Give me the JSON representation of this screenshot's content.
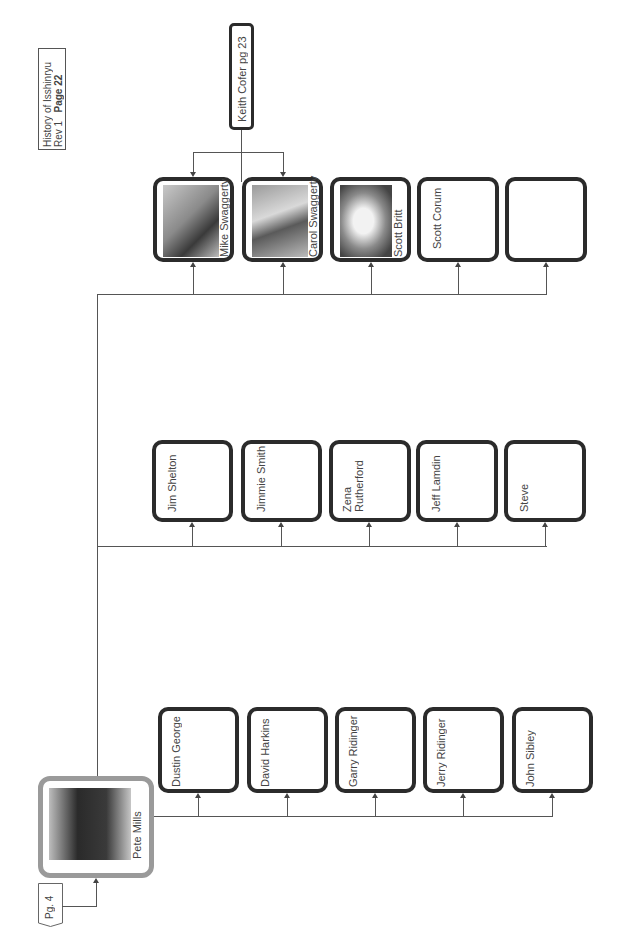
{
  "header": {
    "title": "History of Isshinryu",
    "rev": "Rev 1",
    "page_label": "Page 22"
  },
  "root": {
    "name": "Pete Mills",
    "has_photo": true,
    "page_ref": "Pg. 4"
  },
  "external": {
    "label": "Keith Cofer pg 23"
  },
  "rows": [
    {
      "students": [
        {
          "name": "Mike Swaggerty",
          "has_photo": true
        },
        {
          "name": "Carol Swaggerty",
          "has_photo": true
        },
        {
          "name": "Scott Britt",
          "has_photo": true
        },
        {
          "name": "Scott Corum",
          "has_photo": false
        },
        {
          "name": "",
          "has_photo": false
        }
      ]
    },
    {
      "students": [
        {
          "name": "Jim Shelton"
        },
        {
          "name": "Jimmie Smith"
        },
        {
          "name": "Zena Rutherford"
        },
        {
          "name": "Jeff Lamdin"
        },
        {
          "name": "Steve"
        }
      ]
    },
    {
      "students": [
        {
          "name": "Dustin George"
        },
        {
          "name": "David Harkins"
        },
        {
          "name": "Garry Ridinger"
        },
        {
          "name": "Jerry Ridinger"
        },
        {
          "name": "John Sibley"
        }
      ]
    }
  ]
}
